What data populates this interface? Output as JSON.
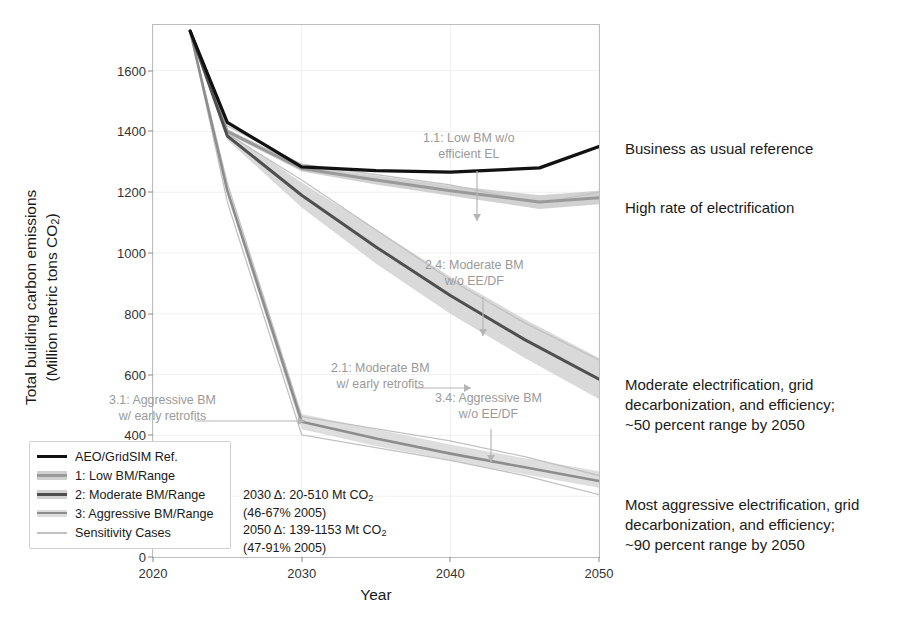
{
  "chart_data": {
    "type": "line",
    "title": "",
    "xlabel": "Year",
    "ylabel": "Total building carbon emissions (Million metric tons CO2)",
    "ylabel_line1": "Total building carbon emissions",
    "ylabel_line2": "(Million metric tons CO",
    "ylabel_sub": "2",
    "ylabel_line2_end": ")",
    "xlim": [
      2020,
      2050
    ],
    "ylim": [
      0,
      1750
    ],
    "xticks": [
      2020,
      2030,
      2040,
      2050
    ],
    "yticks": [
      0,
      200,
      400,
      600,
      800,
      1000,
      1200,
      1400,
      1600
    ],
    "grid": true,
    "legend_position": "lower-left-inside",
    "series": [
      {
        "name": "AEO/GridSIM Ref.",
        "key": "ref",
        "color": "#111111",
        "kind": "line",
        "width": 3.2,
        "x": [
          2022.5,
          2025,
          2030,
          2035,
          2040,
          2046,
          2050
        ],
        "values": [
          1730,
          1430,
          1283,
          1271,
          1266,
          1280,
          1350
        ]
      },
      {
        "name": "1: Low BM/Range",
        "key": "low",
        "color": "#9a9a9a",
        "band_color": "#c9c9c9",
        "kind": "band",
        "width": 3.0,
        "x": [
          2022.5,
          2025,
          2030,
          2035,
          2040,
          2046,
          2050
        ],
        "values": [
          1730,
          1400,
          1278,
          1240,
          1205,
          1168,
          1182
        ],
        "lower": [
          1730,
          1392,
          1268,
          1225,
          1188,
          1145,
          1160
        ],
        "upper": [
          1730,
          1408,
          1288,
          1255,
          1222,
          1190,
          1205
        ]
      },
      {
        "name": "2: Moderate BM/Range",
        "key": "moderate",
        "color": "#4f4f4f",
        "band_color": "#d2d2d2",
        "kind": "band",
        "width": 3.0,
        "x": [
          2022.5,
          2025,
          2030,
          2035,
          2040,
          2045,
          2050
        ],
        "values": [
          1730,
          1385,
          1190,
          1020,
          860,
          715,
          585
        ],
        "lower": [
          1730,
          1372,
          1150,
          965,
          800,
          655,
          520
        ],
        "upper": [
          1730,
          1398,
          1232,
          1078,
          922,
          782,
          655
        ]
      },
      {
        "name": "3: Aggressive BM/Range",
        "key": "aggressive",
        "color": "#8d8d8d",
        "band_color": "#d8d8d8",
        "kind": "band",
        "width": 2.6,
        "x": [
          2022.5,
          2025,
          2030,
          2035,
          2040,
          2045,
          2050
        ],
        "values": [
          1730,
          1205,
          445,
          390,
          340,
          295,
          250
        ],
        "lower": [
          1730,
          1190,
          420,
          365,
          318,
          272,
          228
        ],
        "upper": [
          1730,
          1222,
          470,
          420,
          370,
          325,
          282
        ]
      },
      {
        "name": "Sensitivity Cases",
        "key": "sensitivity",
        "color": "#c2c2c2",
        "kind": "thin",
        "width": 1.3,
        "cases": [
          {
            "x": [
              2022.5,
              2025,
              2030,
              2040,
              2046,
              2050
            ],
            "values": [
              1730,
              1418,
              1292,
              1224,
              1163,
              1200
            ]
          },
          {
            "x": [
              2022.5,
              2025,
              2030,
              2040,
              2045,
              2050
            ],
            "values": [
              1730,
              1392,
              1240,
              912,
              770,
              648
            ]
          },
          {
            "x": [
              2022.5,
              2025,
              2030,
              2040,
              2045,
              2050
            ],
            "values": [
              1730,
              1168,
              402,
              318,
              268,
              205
            ]
          },
          {
            "x": [
              2022.5,
              2025,
              2030,
              2040,
              2045,
              2050
            ],
            "values": [
              1730,
              1230,
              462,
              382,
              330,
              268
            ]
          }
        ]
      }
    ],
    "callouts": [
      {
        "id": "c11",
        "text_line1": "1.1: Low BM w/o",
        "text_line2": "efficient EL",
        "arrow": "down"
      },
      {
        "id": "c24",
        "text_line1": "2.4: Moderate BM",
        "text_line2": "w/o EE/DF",
        "arrow": "down"
      },
      {
        "id": "c21",
        "text_line1": "2.1: Moderate BM",
        "text_line2": "w/ early retrofits",
        "arrow": "right"
      },
      {
        "id": "c34",
        "text_line1": "3.4: Aggressive BM",
        "text_line2": "w/o EE/DF",
        "arrow": "down"
      },
      {
        "id": "c31",
        "text_line1": "3.1: Aggressive BM",
        "text_line2": "w/ early retrofits",
        "arrow": "right"
      }
    ],
    "annotations": {
      "delta_line1": "2030 Δ: 20-510 Mt CO",
      "delta_line1_sub": "2",
      "delta_line2": "(46-67% 2005)",
      "delta_line3": "2050 Δ: 139-1153 Mt CO",
      "delta_line3_sub": "2",
      "delta_line4": "(47-91% 2005)"
    }
  },
  "legend": {
    "items": [
      {
        "label": "AEO/GridSIM Ref.",
        "style": "solid-black"
      },
      {
        "label": "1: Low BM/Range",
        "style": "band-light"
      },
      {
        "label": "2: Moderate BM/Range",
        "style": "band-dark"
      },
      {
        "label": "3: Aggressive BM/Range",
        "style": "band-mid"
      },
      {
        "label": "Sensitivity Cases",
        "style": "thin-light"
      }
    ]
  },
  "side_notes": [
    {
      "text": "Business as usual reference"
    },
    {
      "text": "High rate of electrification"
    },
    {
      "line1": "Moderate electrification, grid",
      "line2": "decarbonization, and efficiency;",
      "line3": "~50 percent range by 2050"
    },
    {
      "line1": "Most aggressive electrification, grid",
      "line2": "decarbonization, and efficiency;",
      "line3": "~90 percent range by 2050"
    }
  ]
}
